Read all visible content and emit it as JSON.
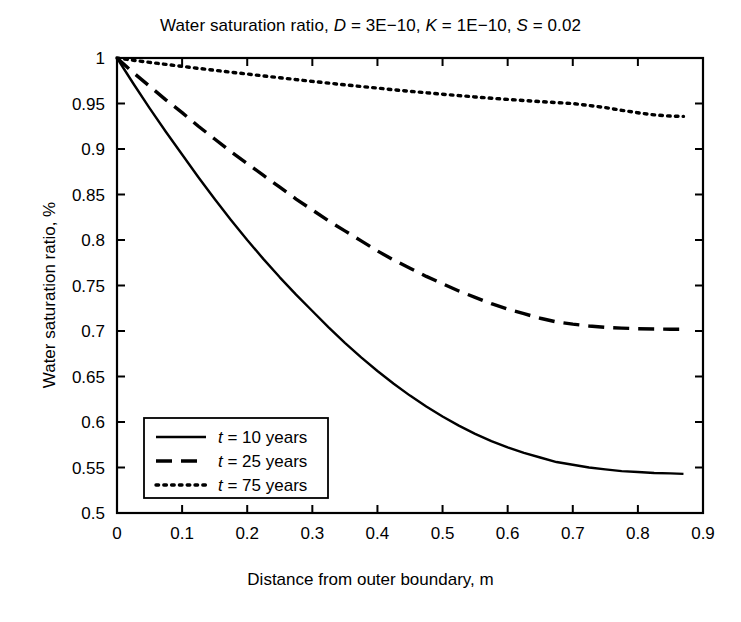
{
  "chart_data": {
    "type": "line",
    "title": "Water saturation ratio, D = 3E−10, K = 1E−10, S = 0.02",
    "title_parts": {
      "prefix": "Water saturation ratio, ",
      "sym_d": "D",
      "d_value": " = 3E−10, ",
      "sym_k": "K",
      "k_value": " = 1E−10, ",
      "sym_s": "S",
      "s_value": " = 0.02"
    },
    "xlabel": "Distance from outer boundary, m",
    "ylabel": "Water saturation ratio, %",
    "xlim": [
      0,
      0.9
    ],
    "ylim": [
      0.5,
      1
    ],
    "xticks": [
      "0",
      "0.1",
      "0.2",
      "0.3",
      "0.4",
      "0.5",
      "0.6",
      "0.7",
      "0.8",
      "0.9"
    ],
    "xtick_values": [
      0,
      0.1,
      0.2,
      0.3,
      0.4,
      0.5,
      0.6,
      0.7,
      0.8,
      0.9
    ],
    "yticks": [
      "0.5",
      "0.55",
      "0.6",
      "0.65",
      "0.7",
      "0.75",
      "0.8",
      "0.85",
      "0.9",
      "0.95",
      "1"
    ],
    "ytick_values": [
      0.5,
      0.55,
      0.6,
      0.65,
      0.7,
      0.75,
      0.8,
      0.85,
      0.9,
      0.95,
      1
    ],
    "grid": false,
    "legend_position": "lower-left",
    "x": [
      0,
      0.025,
      0.05,
      0.075,
      0.1,
      0.125,
      0.15,
      0.175,
      0.2,
      0.225,
      0.25,
      0.275,
      0.3,
      0.325,
      0.35,
      0.375,
      0.4,
      0.425,
      0.45,
      0.475,
      0.5,
      0.525,
      0.55,
      0.575,
      0.6,
      0.625,
      0.65,
      0.675,
      0.7,
      0.725,
      0.75,
      0.775,
      0.8,
      0.825,
      0.85,
      0.87
    ],
    "series": [
      {
        "name": "t = 10 years",
        "label_parts": {
          "sym": "t",
          "rest": " = 10 years"
        },
        "style": "solid",
        "color": "#000000",
        "values": [
          1.0,
          0.972,
          0.945,
          0.919,
          0.894,
          0.869,
          0.845,
          0.822,
          0.8,
          0.779,
          0.759,
          0.74,
          0.722,
          0.704,
          0.687,
          0.671,
          0.656,
          0.642,
          0.629,
          0.617,
          0.606,
          0.596,
          0.587,
          0.579,
          0.572,
          0.566,
          0.561,
          0.556,
          0.553,
          0.55,
          0.548,
          0.546,
          0.545,
          0.544,
          0.5435,
          0.543
        ]
      },
      {
        "name": "t = 25 years",
        "label_parts": {
          "sym": "t",
          "rest": " = 25 years"
        },
        "style": "dashed",
        "color": "#000000",
        "values": [
          1.0,
          0.984,
          0.969,
          0.954,
          0.94,
          0.925,
          0.911,
          0.897,
          0.884,
          0.871,
          0.858,
          0.845,
          0.833,
          0.821,
          0.81,
          0.799,
          0.788,
          0.778,
          0.769,
          0.76,
          0.752,
          0.744,
          0.737,
          0.73,
          0.724,
          0.719,
          0.714,
          0.71,
          0.7075,
          0.7055,
          0.704,
          0.7032,
          0.7025,
          0.7022,
          0.702,
          0.702
        ]
      },
      {
        "name": "t = 75 years",
        "label_parts": {
          "sym": "t",
          "rest": " = 75 years"
        },
        "style": "dotted",
        "color": "#000000",
        "values": [
          1.0,
          0.9975,
          0.9952,
          0.993,
          0.9908,
          0.9886,
          0.9865,
          0.9844,
          0.9824,
          0.9803,
          0.9783,
          0.9763,
          0.9743,
          0.9724,
          0.9705,
          0.9687,
          0.9669,
          0.9651,
          0.9634,
          0.9618,
          0.9602,
          0.9587,
          0.9572,
          0.9558,
          0.9545,
          0.9533,
          0.9521,
          0.951,
          0.95,
          0.9478,
          0.9455,
          0.9425,
          0.9398,
          0.9375,
          0.9362,
          0.9358
        ]
      }
    ]
  },
  "legend": {
    "items": [
      {
        "sym": "t",
        "rest": " = 10 years",
        "style": "solid"
      },
      {
        "sym": "t",
        "rest": " = 25 years",
        "style": "dashed"
      },
      {
        "sym": "t",
        "rest": " = 75 years",
        "style": "dotted"
      }
    ]
  }
}
